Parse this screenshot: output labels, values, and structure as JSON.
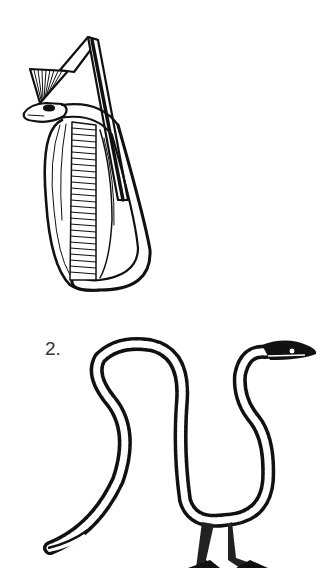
{
  "figures": [
    {
      "id": 1,
      "subject": "cobra-uraeus-with-crown",
      "label": ""
    },
    {
      "id": 2,
      "subject": "walking-serpent-with-legs",
      "label": "2."
    }
  ],
  "colors": {
    "ink": "#111111",
    "background": "#ffffff"
  }
}
